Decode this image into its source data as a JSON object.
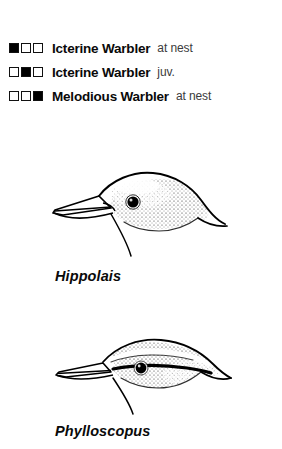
{
  "figure": {
    "legend": {
      "swatch_count": 3,
      "colors": {
        "fill": "#000000",
        "empty": "#ffffff",
        "outline": "#111111"
      },
      "rows": [
        {
          "pattern": [
            true,
            false,
            false
          ],
          "species": "Icterine Warbler",
          "qualifier": "at nest"
        },
        {
          "pattern": [
            false,
            true,
            false
          ],
          "species": "Icterine Warbler",
          "qualifier": "juv."
        },
        {
          "pattern": [
            false,
            false,
            true
          ],
          "species": "Melodious Warbler",
          "qualifier": "at nest"
        }
      ]
    },
    "illustrations": [
      {
        "id": "hippolais",
        "genus": "Hippolais",
        "subject": "warbler-head-profile",
        "traits": "stout broad bill, peaked rounded crown, plain face, dark eye"
      },
      {
        "id": "phylloscopus",
        "genus": "Phylloscopus",
        "subject": "warbler-head-profile",
        "traits": "fine slender bill, flat crown, pale supercilium over dark eye-stripe"
      }
    ]
  }
}
